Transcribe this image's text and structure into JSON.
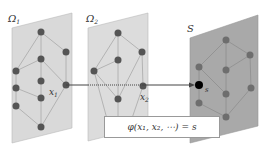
{
  "diagram": {
    "panels": [
      {
        "id": "omega1",
        "label": "Ω",
        "subscript": "1",
        "fill": "#d9d9d9"
      },
      {
        "id": "omega2",
        "label": "Ω",
        "subscript": "2",
        "fill": "#dcdcdc"
      },
      {
        "id": "s",
        "label": "S",
        "subscript": "",
        "fill": "#a9a9a9"
      }
    ],
    "point_labels": {
      "x1": "x",
      "x1_sub": "1",
      "x2": "x",
      "x2_sub": "2",
      "s": "s"
    },
    "formula": "φ(x₁, x₂, ⋯) = s",
    "colors": {
      "node": "#555555",
      "edge": "#aaaaaa",
      "arrow": "#444444",
      "target_node": "#000000"
    }
  }
}
